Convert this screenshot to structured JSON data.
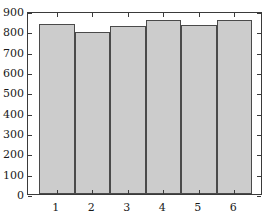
{
  "chart_data": {
    "type": "bar",
    "title": "",
    "xlabel": "",
    "ylabel": "",
    "categories": [
      "1",
      "2",
      "3",
      "4",
      "5",
      "6"
    ],
    "values": [
      835,
      795,
      827,
      855,
      832,
      857
    ],
    "ylim": [
      0,
      900
    ],
    "yticks": [
      0,
      100,
      200,
      300,
      400,
      500,
      600,
      700,
      800,
      900
    ],
    "ytick_labels": [
      "0",
      "100",
      "200",
      "300",
      "400",
      "500",
      "600",
      "700",
      "800",
      "900"
    ],
    "xtick_labels": [
      "1",
      "2",
      "3",
      "4",
      "5",
      "6"
    ],
    "grid": false,
    "legend": null,
    "bar_fill_color": "#cccccc",
    "bar_edge_color": "#4a4a4a",
    "axis_color": "#3a3a3a",
    "background_color": "#ffffff",
    "tick_direction": "in",
    "bars_adjacent": true
  }
}
